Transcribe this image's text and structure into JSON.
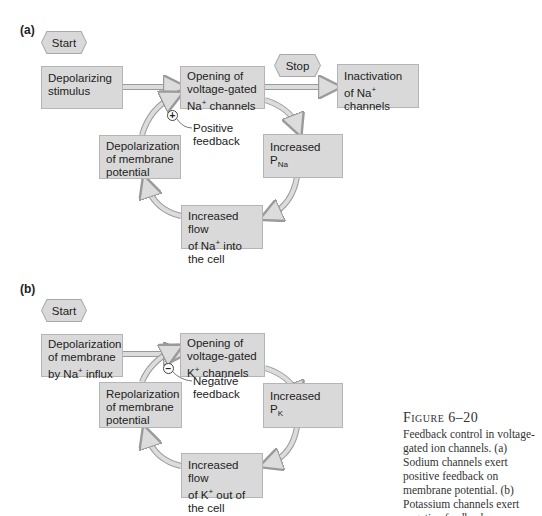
{
  "panel_a": {
    "label": "(a)",
    "start_label": "Start",
    "stop_label": "Stop",
    "boxes": {
      "stimulus": {
        "line1": "Depolarizing",
        "line2": "stimulus"
      },
      "opening": {
        "line1": "Opening of",
        "line2": "voltage-gated",
        "line3_pre": "Na",
        "line3_sup": "+",
        "line3_post": " channels"
      },
      "inactivation": {
        "line1": "Inactivation",
        "line2_pre": "of Na",
        "line2_sup": "+",
        "line2_post": " channels"
      },
      "depolarization": {
        "line1": "Depolarization",
        "line2": "of membrane",
        "line3": "potential"
      },
      "increased_p": {
        "main": "Increased P",
        "sub": "Na"
      },
      "increased_flow": {
        "line1": "Increased flow",
        "line2_pre": "of Na",
        "line2_sup": "+",
        "line2_post": " into",
        "line3": "the cell"
      }
    },
    "feedback": {
      "sign": "+",
      "line1": "Positive",
      "line2": "feedback"
    }
  },
  "panel_b": {
    "label": "(b)",
    "start_label": "Start",
    "boxes": {
      "depolarization_influx": {
        "line1": "Depolarization",
        "line2": "of membrane",
        "line3_pre": "by Na",
        "line3_sup": "+",
        "line3_post": " influx"
      },
      "opening": {
        "line1": "Opening of",
        "line2": "voltage-gated",
        "line3_pre": "K",
        "line3_sup": "+",
        "line3_post": " channels"
      },
      "repolarization": {
        "line1": "Repolarization",
        "line2": "of membrane",
        "line3": "potential"
      },
      "increased_p": {
        "main": "Increased P",
        "sub": "K"
      },
      "increased_flow": {
        "line1": "Increased flow",
        "line2_pre": "of K",
        "line2_sup": "+",
        "line2_post": " out of",
        "line3": "the cell"
      }
    },
    "feedback": {
      "sign": "−",
      "line1": "Negative",
      "line2": "feedback"
    }
  },
  "caption": {
    "title": "Figure 6–20",
    "text": "Feedback control in voltage-gated ion channels. (a) Sodium channels exert positive feedback on membrane potential. (b) Potassium channels exert negative feedback."
  },
  "colors": {
    "box_fill": "#d9d9d9",
    "box_border": "#b5b5b5",
    "arrow_fill": "#dcdcdc",
    "arrow_stroke": "#9a9a9a"
  }
}
